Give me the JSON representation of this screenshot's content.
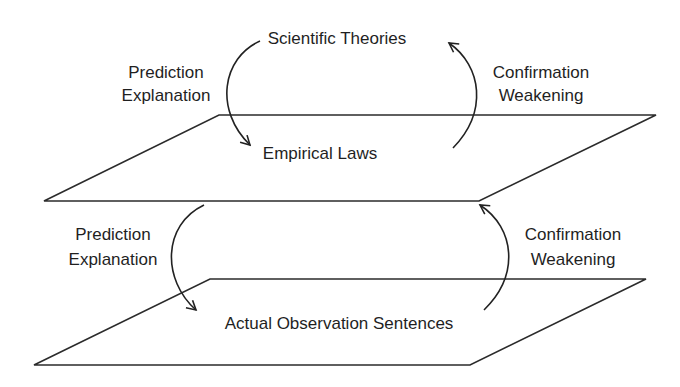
{
  "diagram": {
    "type": "layered-flow",
    "levels": [
      {
        "id": "theories",
        "label": "Scientific Theories"
      },
      {
        "id": "laws",
        "label": "Empirical Laws"
      },
      {
        "id": "observations",
        "label": "Actual Observation Sentences"
      }
    ],
    "upper": {
      "down_label_1": "Prediction",
      "down_label_2": "Explanation",
      "up_label_1": "Confirmation",
      "up_label_2": "Weakening"
    },
    "lower": {
      "down_label_1": "Prediction",
      "down_label_2": "Explanation",
      "up_label_1": "Confirmation",
      "up_label_2": "Weakening"
    },
    "edges": [
      {
        "from": "Scientific Theories",
        "to": "Empirical Laws",
        "label": "Prediction / Explanation"
      },
      {
        "from": "Empirical Laws",
        "to": "Scientific Theories",
        "label": "Confirmation / Weakening"
      },
      {
        "from": "Empirical Laws",
        "to": "Actual Observation Sentences",
        "label": "Prediction / Explanation"
      },
      {
        "from": "Actual Observation Sentences",
        "to": "Empirical Laws",
        "label": "Confirmation / Weakening"
      }
    ]
  }
}
